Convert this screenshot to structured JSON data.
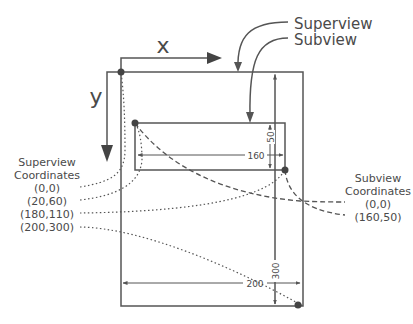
{
  "axes": {
    "x_label": "x",
    "y_label": "y"
  },
  "callouts": {
    "superview": "Superview",
    "subview": "Subview"
  },
  "dimensions": {
    "subview_width": "160",
    "subview_height": "50",
    "superview_width": "200",
    "superview_height": "300"
  },
  "superview_coordinates": {
    "title_line1": "Superview",
    "title_line2": "Coordinates",
    "points": [
      "(0,0)",
      "(20,60)",
      "(180,110)",
      "(200,300)"
    ]
  },
  "subview_coordinates": {
    "title_line1": "Subview",
    "title_line2": "Coordinates",
    "points": [
      "(0,0)",
      "(160,50)"
    ]
  },
  "colors": {
    "line": "#555555",
    "text": "#4a4a4a",
    "dot": "#444444"
  }
}
